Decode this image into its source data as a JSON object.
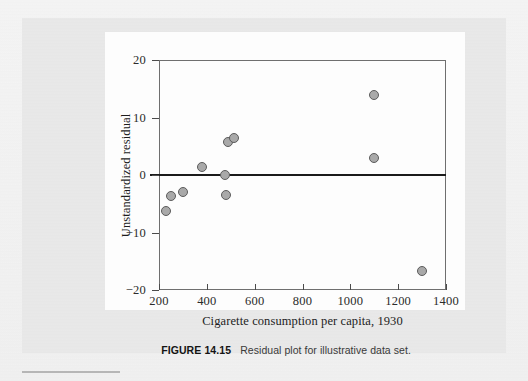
{
  "caption": {
    "label": "FIGURE 14.15",
    "text": "Residual plot for illustrative data set."
  },
  "colors": {
    "marker_fill": "#a9a9a9",
    "marker_edge": "#5c5c5c",
    "zero_line": "#1b1b1b",
    "axis": "#6f6f6f",
    "page_background": "#f2f2f2",
    "figure_background": "#e9e9e9",
    "chart_background": "#fdfdfd"
  },
  "chart_data": {
    "type": "scatter",
    "title": "",
    "xlabel": "Cigarette consumption per capita, 1930",
    "ylabel": "Unstandardized residual",
    "xlim": [
      200,
      1400
    ],
    "ylim": [
      -20,
      20
    ],
    "xticks": [
      200,
      400,
      600,
      800,
      1000,
      1200,
      1400
    ],
    "yticks": [
      20,
      10,
      0,
      -10,
      -20
    ],
    "xticklabels": [
      "200",
      "400",
      "600",
      "800",
      "1000",
      "1200",
      "1400"
    ],
    "yticklabels": [
      "20",
      "10",
      "0",
      "-10",
      "-20"
    ],
    "grid": false,
    "legend": null,
    "reference_lines": [
      {
        "orientation": "horizontal",
        "value": 0
      }
    ],
    "points": [
      {
        "x": 230,
        "y": -6.2
      },
      {
        "x": 250,
        "y": -3.7
      },
      {
        "x": 300,
        "y": -3.0
      },
      {
        "x": 380,
        "y": 1.4
      },
      {
        "x": 475,
        "y": 0.0
      },
      {
        "x": 480,
        "y": -3.4
      },
      {
        "x": 490,
        "y": 5.8
      },
      {
        "x": 512,
        "y": 6.4
      },
      {
        "x": 1100,
        "y": 14.0
      },
      {
        "x": 1100,
        "y": 3.0
      },
      {
        "x": 1300,
        "y": -16.7
      }
    ]
  }
}
